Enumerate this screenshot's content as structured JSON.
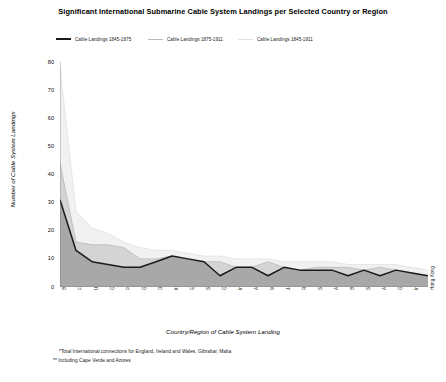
{
  "chart_data": {
    "type": "area",
    "title": "Significant International Submarine Cable System Landings per Selected Country or Region",
    "xlabel": "Country/Region of Cable System Landing",
    "ylabel": "Number of Cable System Landings",
    "ylim": [
      0,
      80
    ],
    "ytick_step": 10,
    "yticks": [
      0,
      10,
      20,
      30,
      40,
      50,
      60,
      70,
      80
    ],
    "grid": false,
    "legend_position": "top-left",
    "categories": [
      "Britain*",
      "France",
      "USA",
      "Canada",
      "Portugal**",
      "Germany",
      "Denmark",
      "Italy",
      "Egypt",
      "Spain",
      "China",
      "Indonesia",
      "Algeria",
      "Malaya",
      "Japan",
      "Russia",
      "Singapore",
      "Aden",
      "Brazil",
      "Sweden",
      "Australia",
      "Greece",
      "India",
      "Hong Kong"
    ],
    "series": [
      {
        "name": "Cable Landings 1845-1875",
        "color": "#1a1a1a",
        "fill": "#a8a8a8",
        "values": [
          31,
          13,
          9,
          8,
          7,
          7,
          9,
          11,
          10,
          9,
          4,
          7,
          7,
          4,
          7,
          6,
          6,
          6,
          4,
          6,
          4,
          6,
          5,
          4
        ]
      },
      {
        "name": "Cable Landings 1875-1911",
        "color": "#b9b9b9",
        "fill": "#d4d4d4",
        "values": [
          44,
          16,
          15,
          15,
          14,
          10,
          10,
          11,
          10,
          9,
          9,
          7,
          7,
          9,
          7,
          6,
          7,
          7,
          7,
          6,
          7,
          6,
          5,
          4
        ]
      },
      {
        "name": "Cable Landings  1845-1911",
        "color": "#e2e2e2",
        "fill": "#f1f1f1",
        "values": [
          78,
          27,
          21,
          19,
          16,
          14,
          13,
          13,
          12,
          11,
          11,
          10,
          10,
          10,
          9,
          9,
          9,
          9,
          8,
          8,
          8,
          8,
          7,
          6
        ]
      }
    ],
    "footnotes": [
      "*Total International connections for England, Ireland and Wales, Gibraltar, Malta",
      "** Including Cape Verde and Azores"
    ]
  }
}
